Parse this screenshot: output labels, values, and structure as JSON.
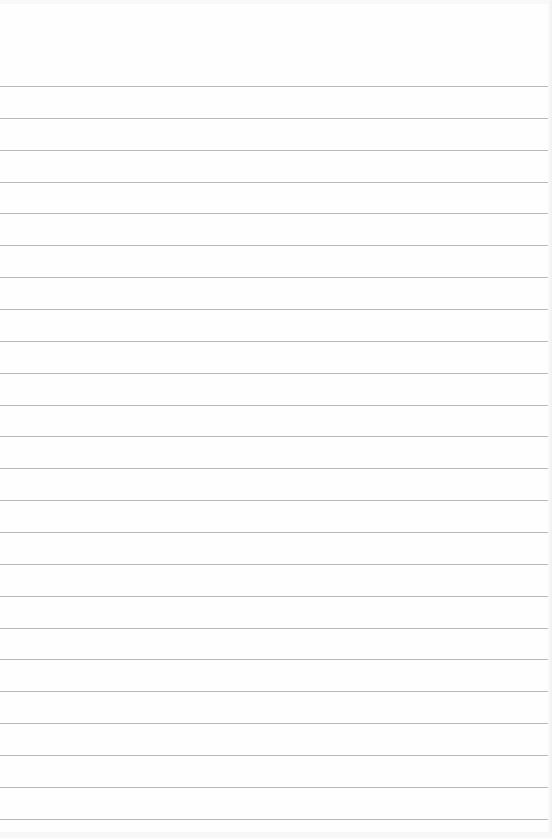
{
  "page": {
    "type": "lined-paper",
    "background_color": "#fefefe",
    "rule_color": "#b9b9b9",
    "rule_count": 24,
    "first_rule_y": 86,
    "rule_spacing": 31.86
  }
}
